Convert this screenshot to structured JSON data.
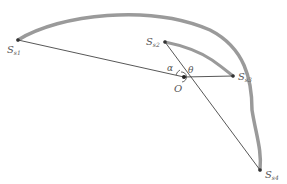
{
  "diagram": {
    "type": "geometry",
    "colors": {
      "line": "#444444",
      "arc": "#9a9a9a",
      "point": "#333333",
      "label": "#555555",
      "background": "#ffffff"
    },
    "points": [
      {
        "id": "S_s1",
        "base": "S",
        "sub": "s1",
        "x": 18,
        "y": 40
      },
      {
        "id": "S_s2",
        "base": "S",
        "sub": "s2",
        "x": 165,
        "y": 42
      },
      {
        "id": "S_s3",
        "base": "S",
        "sub": "s3",
        "x": 233,
        "y": 76
      },
      {
        "id": "S_s4",
        "base": "S",
        "sub": "s4",
        "x": 260,
        "y": 170
      },
      {
        "id": "O",
        "base": "O",
        "sub": "",
        "x": 184,
        "y": 77
      }
    ],
    "labels": {
      "s1": {
        "base": "S",
        "sub": "s1"
      },
      "s2": {
        "base": "S",
        "sub": "s2"
      },
      "s3": {
        "base": "S",
        "sub": "s3"
      },
      "s4": {
        "base": "S",
        "sub": "s4"
      },
      "origin": "O",
      "alpha": "α",
      "theta": "θ"
    },
    "segments": [
      [
        "S_s1",
        "O"
      ],
      [
        "S_s2",
        "S_s4"
      ],
      [
        "O",
        "S_s3"
      ]
    ],
    "arcs": [
      {
        "from": "S_s1",
        "to": "S_s4",
        "style": "thick-gray"
      },
      {
        "from": "S_s2",
        "to": "S_s3",
        "style": "thick-gray"
      }
    ],
    "angles": [
      {
        "label": "α",
        "vertex": "O",
        "between": [
          "S_s1",
          "S_s2"
        ]
      },
      {
        "label": "θ",
        "vertex": "O",
        "between": [
          "S_s2",
          "S_s3"
        ]
      }
    ]
  }
}
